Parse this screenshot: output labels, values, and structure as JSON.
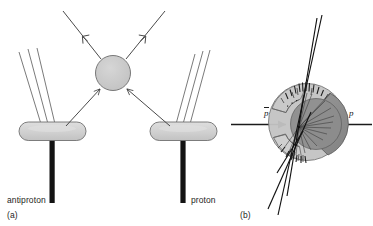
{
  "figure": {
    "kind": "physics-diagram",
    "caption_labels": {
      "panel_a": "(a)",
      "panel_b": "(b)"
    },
    "background_color": "#ffffff",
    "line_color": "#3a3a3a",
    "dark_line_color": "#111111"
  },
  "panel_a": {
    "id": "(a)",
    "description": "Schematic of an antiproton-proton collision producing two jets from each beam detector and two outgoing particles from the central interaction vertex",
    "vertex": {
      "name": "interaction-blob",
      "fill": "#c9c9c9",
      "stroke": "#6e6e6e",
      "cx": 113,
      "cy": 73,
      "r": 17
    },
    "outgoing_tracks": [
      {
        "name": "outgoing-track-left",
        "x1": 102,
        "y1": 60,
        "x2": 62,
        "y2": 10,
        "arrow_at": 0.45,
        "direction": "up-left"
      },
      {
        "name": "outgoing-track-right",
        "x1": 125,
        "y1": 60,
        "x2": 165,
        "y2": 10,
        "arrow_at": 0.45,
        "direction": "up-right"
      }
    ],
    "incoming_tracks": [
      {
        "name": "incoming-track-left",
        "x1": 63,
        "y1": 128,
        "x2": 101,
        "y2": 88,
        "arrow_at": 0.72,
        "direction": "up-right"
      },
      {
        "name": "incoming-track-right",
        "x1": 165,
        "y1": 128,
        "x2": 126,
        "y2": 88,
        "arrow_at": 0.72,
        "direction": "up-left"
      }
    ],
    "beam_arms": [
      {
        "name": "antiproton-arm",
        "label": "antiproton",
        "pill": {
          "cx": 52,
          "cy": 131,
          "rx": 33,
          "ry": 9,
          "fill": "#d2d2d2",
          "stroke": "#6e6e6e"
        },
        "stem": {
          "x": 52,
          "y_top": 138,
          "y_bottom": 203,
          "width": 5,
          "color": "#141414"
        },
        "jets": [
          {
            "x1": 40,
            "y1": 124,
            "x2": 18,
            "y2": 50
          },
          {
            "x1": 47,
            "y1": 124,
            "x2": 27,
            "y2": 48
          },
          {
            "x1": 54,
            "y1": 124,
            "x2": 36,
            "y2": 47
          }
        ]
      },
      {
        "name": "proton-arm",
        "label": "proton",
        "pill": {
          "cx": 183,
          "cy": 131,
          "rx": 33,
          "ry": 9,
          "fill": "#d2d2d2",
          "stroke": "#6e6e6e"
        },
        "stem": {
          "x": 183,
          "y_top": 138,
          "y_bottom": 203,
          "width": 5,
          "color": "#141414"
        },
        "jets": [
          {
            "x1": 177,
            "y1": 124,
            "x2": 196,
            "y2": 52
          },
          {
            "x1": 184,
            "y1": 124,
            "x2": 203,
            "y2": 50
          },
          {
            "x1": 191,
            "y1": 124,
            "x2": 210,
            "y2": 49
          }
        ]
      }
    ],
    "labels": {
      "left_beam": "antiproton",
      "right_beam": "proton",
      "panel": "(a)"
    }
  },
  "panel_b": {
    "id": "(b)",
    "description": "Cut-away view of a cylindrical collider detector showing reconstructed particle tracks from a proton-antiproton annihilation at the centre",
    "panel": "(b)",
    "beams": {
      "left": {
        "name": "antiproton-beam-arrow",
        "label": "p",
        "label_overbar": true,
        "label_text": "p̄",
        "arrow": {
          "x1": 232,
          "y1": 124,
          "x2": 288,
          "y2": 124,
          "direction": "right"
        }
      },
      "right": {
        "name": "proton-beam-arrow",
        "label": "p",
        "label_overbar": false,
        "label_text": "p",
        "arrow": {
          "x1": 370,
          "y1": 124,
          "x2": 322,
          "y2": 124,
          "direction": "left"
        }
      }
    },
    "detector": {
      "name": "detector-barrel",
      "cx": 306,
      "cy": 122,
      "r": 39,
      "outer_fill": "#b9b9b9",
      "body_fill": "#c6c6c6",
      "inner_wedge_fill": "#8f8f8f",
      "stroke": "#5c5c5c",
      "cutaway": true
    },
    "vertex": {
      "name": "event-vertex",
      "x": 299,
      "y": 127
    },
    "track_count_long": 4,
    "track_count_short": 16,
    "tick_count": 22
  }
}
